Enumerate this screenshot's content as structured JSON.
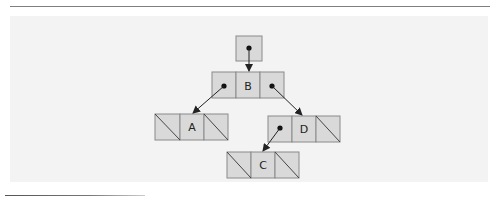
{
  "diagram": {
    "type": "binary-tree-linked-nodes",
    "colors": {
      "panel_bg": "#f3f3f3",
      "cell_fill": "#d9d9d9",
      "cell_stroke": "#8a8a8a",
      "arrow": "#222222"
    },
    "root_pointer": {
      "label": ""
    },
    "nodes": [
      {
        "id": "B",
        "label": "B",
        "left": "pointer",
        "right": "pointer"
      },
      {
        "id": "A",
        "label": "A",
        "left": "null",
        "right": "null"
      },
      {
        "id": "D",
        "label": "D",
        "left": "pointer",
        "right": "null"
      },
      {
        "id": "C",
        "label": "C",
        "left": "null",
        "right": "null"
      }
    ],
    "edges": [
      {
        "from": "root",
        "to": "B"
      },
      {
        "from": "B.left",
        "to": "A"
      },
      {
        "from": "B.right",
        "to": "D"
      },
      {
        "from": "D.left",
        "to": "C"
      }
    ]
  }
}
